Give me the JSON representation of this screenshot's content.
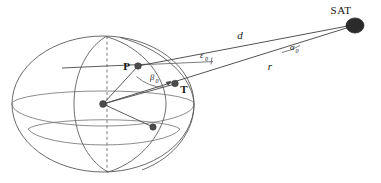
{
  "figure": {
    "title_implicit": "Satellite look-angle geometry over a spherical Earth",
    "background_color": "#ffffff",
    "line_color": "#4a4a4a",
    "sphere_color": "#5d5d5d",
    "axis_color": "#7a7a7a",
    "label_color": "#141414"
  },
  "labels": {
    "satellite": "SAT",
    "observer_point": "P",
    "subsatellite_point": "T",
    "slant_range": "d",
    "orbit_radius": "r",
    "elevation_symbol": "ε",
    "elevation_subscript": "0",
    "central_symbol": "β",
    "central_subscript": "0",
    "azimuth_symbol": "α",
    "azimuth_subscript": "0"
  },
  "geometry": {
    "sphere_center": {
      "x": 103,
      "y": 104
    },
    "sphere_rx": 91,
    "sphere_ry": 68,
    "equator_ry": 22,
    "polar_axis_top": {
      "x": 107,
      "y": 37
    },
    "polar_axis_bottom": {
      "x": 107,
      "y": 172
    },
    "point_p": {
      "x": 138,
      "y": 66
    },
    "point_t": {
      "x": 175,
      "y": 84
    },
    "point_equator_node": {
      "x": 153,
      "y": 127
    },
    "satellite": {
      "x": 355,
      "y": 25
    },
    "sat_radius": 8.5,
    "tangent_start": {
      "x": 62,
      "y": 68
    },
    "tangent_end": {
      "x": 152,
      "y": 64
    }
  },
  "elements": [
    {
      "name": "outer-sphere-outline",
      "kind": "ellipse"
    },
    {
      "name": "equator-ellipse",
      "kind": "ellipse-arc"
    },
    {
      "name": "lower-latitude-ellipse",
      "kind": "ellipse-arc"
    },
    {
      "name": "meridian-through-p",
      "kind": "ellipse-arc"
    },
    {
      "name": "meridian-right",
      "kind": "ellipse-arc"
    },
    {
      "name": "polar-axis",
      "kind": "dashed-line"
    },
    {
      "name": "slant-range-line",
      "kind": "line"
    },
    {
      "name": "orbit-radius-line",
      "kind": "line"
    },
    {
      "name": "radius-to-p",
      "kind": "line"
    },
    {
      "name": "radius-to-t",
      "kind": "line"
    },
    {
      "name": "radius-to-equator-node",
      "kind": "line"
    },
    {
      "name": "local-horizon-tangent",
      "kind": "line"
    },
    {
      "name": "elevation-angle-arc",
      "kind": "arc"
    },
    {
      "name": "central-angle-arc",
      "kind": "arc"
    },
    {
      "name": "azimuth-angle-arc",
      "kind": "arc"
    }
  ]
}
